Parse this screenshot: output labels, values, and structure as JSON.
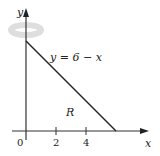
{
  "diagram": {
    "type": "region-of-revolution",
    "axes": {
      "x_label": "x",
      "y_label": "y",
      "origin_label": "0",
      "x_ticks": [
        {
          "value": 2,
          "label": "2"
        },
        {
          "value": 4,
          "label": "4"
        }
      ]
    },
    "curve": {
      "equation_label": "y = 6 − x",
      "from": [
        0,
        6
      ],
      "to": [
        6,
        0
      ]
    },
    "region_label": "R",
    "rotation_axis": "y-axis",
    "colors": {
      "axis": "#333333",
      "line": "#222222",
      "rotation_arrow": "#dcdcdc"
    }
  }
}
